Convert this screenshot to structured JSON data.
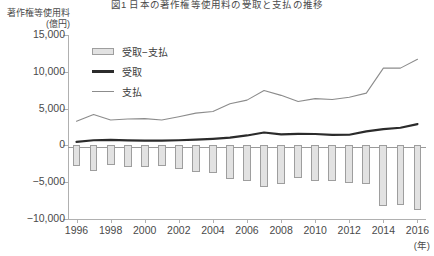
{
  "title": "図1 日本の著作権等使用料の受取と支払の推移",
  "axes": {
    "y_unit_line1": "著作権等使用料",
    "y_unit_line2": "(億円)",
    "x_unit": "(年)",
    "y_ticks": [
      "15,000",
      "10,000",
      "5,000",
      "0",
      "−5,000",
      "−10,000"
    ],
    "y_tick_values": [
      15000,
      10000,
      5000,
      0,
      -5000,
      -10000
    ],
    "x_ticks": [
      "1996",
      "1998",
      "2000",
      "2002",
      "2004",
      "2006",
      "2008",
      "2010",
      "2012",
      "2014",
      "2016"
    ]
  },
  "legend": {
    "items": [
      {
        "label": "受取−支払",
        "type": "bar",
        "color": "#e2e2e2"
      },
      {
        "label": "受取",
        "type": "thick-line",
        "color": "#2b2b2b"
      },
      {
        "label": "支払",
        "type": "thin-line",
        "color": "#8c8c8c"
      }
    ]
  },
  "chart_data": {
    "type": "bar",
    "title": "図1 日本の著作権等使用料の受取と支払の推移",
    "xlabel": "(年)",
    "ylabel": "著作権等使用料 (億円)",
    "ylim": [
      -10000,
      15000
    ],
    "xlim": [
      1996,
      2016
    ],
    "grid": false,
    "legend_position": "upper-left",
    "categories": [
      1996,
      1997,
      1998,
      1999,
      2000,
      2001,
      2002,
      2003,
      2004,
      2005,
      2006,
      2007,
      2008,
      2009,
      2010,
      2011,
      2012,
      2013,
      2014,
      2015,
      2016
    ],
    "series": [
      {
        "name": "受取−支払",
        "type": "bar",
        "color": "#e2e2e2",
        "values": [
          -2800,
          -3500,
          -2700,
          -2900,
          -3000,
          -2800,
          -3200,
          -3600,
          -3700,
          -4600,
          -4800,
          -5700,
          -5300,
          -4400,
          -4800,
          -4800,
          -5100,
          -5200,
          -8300,
          -8100,
          -8800
        ]
      },
      {
        "name": "受取",
        "type": "line",
        "color": "#2b2b2b",
        "values": [
          480,
          700,
          760,
          680,
          640,
          660,
          700,
          780,
          900,
          1050,
          1350,
          1750,
          1500,
          1560,
          1550,
          1440,
          1450,
          1900,
          2200,
          2400,
          2900
        ]
      },
      {
        "name": "支払",
        "type": "line",
        "color": "#8c8c8c",
        "values": [
          3280,
          4200,
          3460,
          3580,
          3640,
          3460,
          3900,
          4380,
          4600,
          5650,
          6150,
          7450,
          6800,
          5960,
          6350,
          6240,
          6550,
          7100,
          10500,
          10500,
          11700
        ]
      }
    ]
  }
}
